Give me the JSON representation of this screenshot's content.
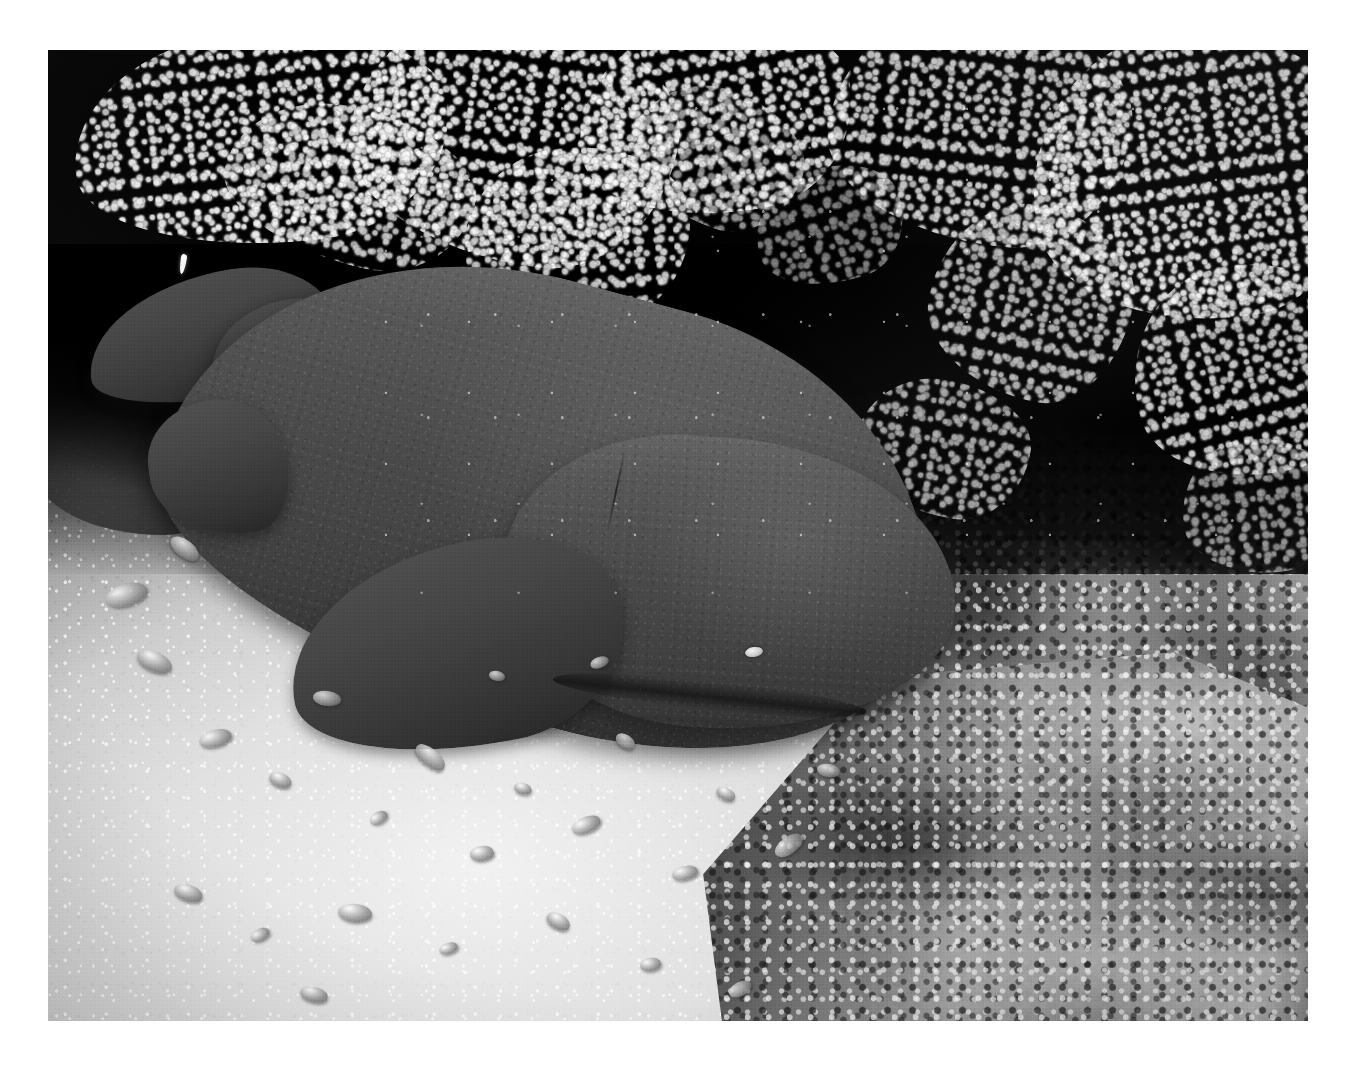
{
  "image": {
    "kind": "photograph",
    "medium": "black-and-white underwater photograph",
    "subject": "nurse shark resting on sandy seafloor under a coral ledge",
    "orientation": "landscape",
    "border": {
      "style": "white print margin",
      "color": "#ffffff"
    },
    "frame": {
      "left": 48,
      "top": 50,
      "width": 1260,
      "height": 971
    },
    "palette": {
      "paper_white": "#ffffff",
      "sand_highlight": "#f2f0ea",
      "sand_midtone": "#cfccc1",
      "reef_light": "#b4b1a8",
      "reef_mid": "#787570",
      "shark_light": "#6a6863",
      "shark_mid": "#4e4c48",
      "shark_dark": "#2e2c29",
      "cave_shadow": "#050505",
      "eye_highlight": "#f4f2ec"
    }
  },
  "scene": {
    "regions": [
      {
        "name": "cave-overhang",
        "description": "deep black coral ledge filling the upper portion of the frame"
      },
      {
        "name": "coralline-algae",
        "description": "bright white encrusting coral and algae fringing the underside of the ledge"
      },
      {
        "name": "reef-wall",
        "description": "mottled coral rubble wall occupying the right third of the frame"
      },
      {
        "name": "sand-floor",
        "description": "bright carbonate sand bottom across the lower-left of the frame"
      },
      {
        "name": "coral-rubble",
        "description": "scattered pebbles, shell fragments and broken coral on the sand"
      },
      {
        "name": "nurse-shark",
        "description": "large shark lying diagonally from upper-left to centre-right"
      },
      {
        "name": "backscatter",
        "description": "suspended particles lit by the strobe in the dark water"
      }
    ],
    "shark": {
      "common_name": "nurse shark",
      "pose": "resting on the bottom, head to the lower right, tail to the upper left",
      "parts": [
        {
          "name": "tail",
          "label": "caudal fin"
        },
        {
          "name": "caudal-peduncle",
          "label": "caudal peduncle"
        },
        {
          "name": "anal-fin",
          "label": "anal fin"
        },
        {
          "name": "pelvic-fin",
          "label": "pelvic fin"
        },
        {
          "name": "flank",
          "label": "body flank"
        },
        {
          "name": "gill-slits",
          "label": "gill slits"
        },
        {
          "name": "pectoral-fin",
          "label": "pectoral fin"
        },
        {
          "name": "head",
          "label": "head"
        },
        {
          "name": "eye",
          "label": "eye"
        },
        {
          "name": "mouth",
          "label": "mouth"
        }
      ]
    },
    "rubble": [
      {
        "x": 12.0,
        "y": 70.0,
        "w": 2.6,
        "h": 1.8,
        "rot": -14
      },
      {
        "x": 17.5,
        "y": 74.5,
        "w": 1.8,
        "h": 1.4,
        "rot": 22
      },
      {
        "x": 21.0,
        "y": 66.0,
        "w": 2.2,
        "h": 1.5,
        "rot": 8
      },
      {
        "x": 25.5,
        "y": 78.5,
        "w": 1.5,
        "h": 1.2,
        "rot": -30
      },
      {
        "x": 29.0,
        "y": 72.0,
        "w": 2.8,
        "h": 1.7,
        "rot": 40
      },
      {
        "x": 33.5,
        "y": 82.0,
        "w": 1.9,
        "h": 1.5,
        "rot": -6
      },
      {
        "x": 37.0,
        "y": 75.5,
        "w": 1.4,
        "h": 1.1,
        "rot": 16
      },
      {
        "x": 41.5,
        "y": 79.0,
        "w": 2.4,
        "h": 1.6,
        "rot": -22
      },
      {
        "x": 45.0,
        "y": 70.5,
        "w": 1.7,
        "h": 1.3,
        "rot": 34
      },
      {
        "x": 49.5,
        "y": 84.0,
        "w": 2.1,
        "h": 1.4,
        "rot": -12
      },
      {
        "x": 53.0,
        "y": 76.0,
        "w": 1.6,
        "h": 1.2,
        "rot": 28
      },
      {
        "x": 57.5,
        "y": 81.0,
        "w": 2.5,
        "h": 1.8,
        "rot": -36
      },
      {
        "x": 61.0,
        "y": 73.5,
        "w": 1.8,
        "h": 1.3,
        "rot": 10
      },
      {
        "x": 10.0,
        "y": 86.0,
        "w": 2.3,
        "h": 1.6,
        "rot": 18
      },
      {
        "x": 16.0,
        "y": 90.5,
        "w": 1.6,
        "h": 1.2,
        "rot": -26
      },
      {
        "x": 23.0,
        "y": 88.0,
        "w": 2.7,
        "h": 1.9,
        "rot": 6
      },
      {
        "x": 31.0,
        "y": 92.0,
        "w": 1.5,
        "h": 1.1,
        "rot": -18
      },
      {
        "x": 39.5,
        "y": 89.0,
        "w": 2.0,
        "h": 1.5,
        "rot": 30
      },
      {
        "x": 47.0,
        "y": 93.5,
        "w": 1.7,
        "h": 1.3,
        "rot": -8
      },
      {
        "x": 35.0,
        "y": 64.0,
        "w": 1.3,
        "h": 1.0,
        "rot": 12
      },
      {
        "x": 43.0,
        "y": 62.5,
        "w": 1.5,
        "h": 1.1,
        "rot": -20
      },
      {
        "x": 7.0,
        "y": 62.0,
        "w": 2.9,
        "h": 2.0,
        "rot": 24
      },
      {
        "x": 4.5,
        "y": 55.0,
        "w": 3.4,
        "h": 2.3,
        "rot": -16
      },
      {
        "x": 9.5,
        "y": 50.5,
        "w": 2.6,
        "h": 1.8,
        "rot": 38
      },
      {
        "x": 54.0,
        "y": 96.0,
        "w": 1.9,
        "h": 1.4,
        "rot": -28
      },
      {
        "x": 20.0,
        "y": 96.5,
        "w": 2.2,
        "h": 1.5,
        "rot": 14
      }
    ],
    "coral_patches": [
      {
        "x": 2,
        "y": -2,
        "w": 30,
        "h": 22,
        "rot": -6,
        "op": 0.95
      },
      {
        "x": 24,
        "y": -4,
        "w": 26,
        "h": 26,
        "rot": 8,
        "op": 0.9
      },
      {
        "x": 42,
        "y": -3,
        "w": 22,
        "h": 20,
        "rot": -10,
        "op": 0.88
      },
      {
        "x": 14,
        "y": 6,
        "w": 20,
        "h": 16,
        "rot": 14,
        "op": 0.8
      },
      {
        "x": 33,
        "y": 10,
        "w": 18,
        "h": 18,
        "rot": -4,
        "op": 0.85
      },
      {
        "x": 62,
        "y": -4,
        "w": 24,
        "h": 24,
        "rot": 6,
        "op": 0.82
      },
      {
        "x": 78,
        "y": -2,
        "w": 26,
        "h": 30,
        "rot": -8,
        "op": 0.9
      },
      {
        "x": 70,
        "y": 16,
        "w": 16,
        "h": 20,
        "rot": 12,
        "op": 0.72
      },
      {
        "x": 86,
        "y": 22,
        "w": 18,
        "h": 22,
        "rot": -14,
        "op": 0.8
      },
      {
        "x": 46,
        "y": 4,
        "w": 14,
        "h": 14,
        "rot": 20,
        "op": 0.6
      },
      {
        "x": 56,
        "y": 12,
        "w": 12,
        "h": 12,
        "rot": -18,
        "op": 0.5
      },
      {
        "x": 64,
        "y": 34,
        "w": 14,
        "h": 14,
        "rot": 10,
        "op": 0.66
      },
      {
        "x": 90,
        "y": 40,
        "w": 12,
        "h": 14,
        "rot": -6,
        "op": 0.58
      }
    ]
  }
}
